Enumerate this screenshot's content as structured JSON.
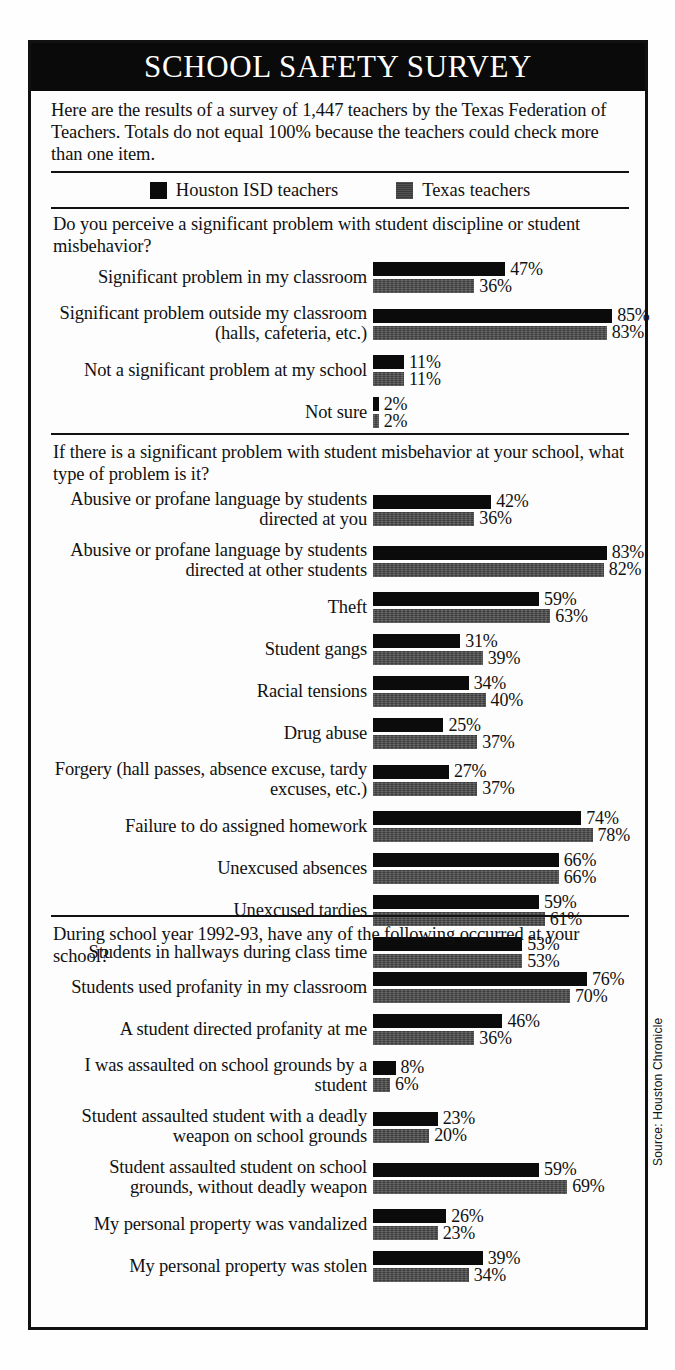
{
  "header": {
    "title": "SCHOOL SAFETY SURVEY"
  },
  "intro": {
    "text": "Here are the results of a survey of 1,447 teachers by the Texas Federation of Teachers. Totals do not equal 100% because the teachers could check more than one item."
  },
  "legend": {
    "series": [
      {
        "name": "houston",
        "label": "Houston ISD teachers",
        "color": "#0b0b0b",
        "swatch": "black"
      },
      {
        "name": "texas",
        "label": "Texas teachers",
        "color": "#3b3b3b",
        "swatch": "gray"
      }
    ]
  },
  "source": {
    "text": "Source:  Houston Chronicle"
  },
  "chart_data": {
    "type": "bar",
    "title": "SCHOOL SAFETY SURVEY",
    "xlabel": "",
    "ylabel": "",
    "xlim": [
      0,
      100
    ],
    "grid": false,
    "legend_position": "top",
    "orientation": "horizontal",
    "value_suffix": "%",
    "series_names": [
      "Houston ISD teachers",
      "Texas teachers"
    ],
    "sections": [
      {
        "question": "Do you perceive a significant problem with student discipline or student misbehavior?",
        "items": [
          {
            "label": "Significant problem in my classroom",
            "houston": 47,
            "texas": 36,
            "houston_text": "47%",
            "texas_text": "36%"
          },
          {
            "label": "Significant problem outside my classroom (halls, cafeteria, etc.)",
            "houston": 85,
            "texas": 83,
            "houston_text": "85%",
            "texas_text": "83%"
          },
          {
            "label": "Not a significant problem at my school",
            "houston": 11,
            "texas": 11,
            "houston_text": "11%",
            "texas_text": "11%"
          },
          {
            "label": "Not sure",
            "houston": 2,
            "texas": 2,
            "houston_text": "2%",
            "texas_text": "2%"
          }
        ]
      },
      {
        "question": "If there is a significant problem with student misbehavior at your school, what type of problem is it?",
        "items": [
          {
            "label": "Abusive or profane language by students directed at you",
            "houston": 42,
            "texas": 36,
            "houston_text": "42%",
            "texas_text": "36%"
          },
          {
            "label": "Abusive or profane language by students directed at other students",
            "houston": 83,
            "texas": 82,
            "houston_text": "83%",
            "texas_text": "82%"
          },
          {
            "label": "Theft",
            "houston": 59,
            "texas": 63,
            "houston_text": "59%",
            "texas_text": "63%"
          },
          {
            "label": "Student gangs",
            "houston": 31,
            "texas": 39,
            "houston_text": "31%",
            "texas_text": "39%"
          },
          {
            "label": "Racial tensions",
            "houston": 34,
            "texas": 40,
            "houston_text": "34%",
            "texas_text": "40%"
          },
          {
            "label": "Drug abuse",
            "houston": 25,
            "texas": 37,
            "houston_text": "25%",
            "texas_text": "37%"
          },
          {
            "label": "Forgery (hall passes, absence excuse, tardy excuses, etc.)",
            "houston": 27,
            "texas": 37,
            "houston_text": "27%",
            "texas_text": "37%"
          },
          {
            "label": "Failure to do assigned homework",
            "houston": 74,
            "texas": 78,
            "houston_text": "74%",
            "texas_text": "78%"
          },
          {
            "label": "Unexcused absences",
            "houston": 66,
            "texas": 66,
            "houston_text": "66%",
            "texas_text": "66%"
          },
          {
            "label": "Unexcused tardies",
            "houston": 59,
            "texas": 61,
            "houston_text": "59%",
            "texas_text": "61%"
          },
          {
            "label": "Students in hallways during class time",
            "houston": 53,
            "texas": 53,
            "houston_text": "53%",
            "texas_text": "53%"
          }
        ]
      },
      {
        "question": "During school year 1992-93, have any of the following occurred at your school?",
        "items": [
          {
            "label": "Students used profanity in my classroom",
            "houston": 76,
            "texas": 70,
            "houston_text": "76%",
            "texas_text": "70%"
          },
          {
            "label": "A student directed profanity at me",
            "houston": 46,
            "texas": 36,
            "houston_text": "46%",
            "texas_text": "36%"
          },
          {
            "label": "I was assaulted on school grounds by a student",
            "houston": 8,
            "texas": 6,
            "houston_text": "8%",
            "texas_text": "6%"
          },
          {
            "label": "Student assaulted student with a deadly weapon on school grounds",
            "houston": 23,
            "texas": 20,
            "houston_text": "23%",
            "texas_text": "20%"
          },
          {
            "label": "Student assaulted student on school grounds, without deadly weapon",
            "houston": 59,
            "texas": 69,
            "houston_text": "59%",
            "texas_text": "69%"
          },
          {
            "label": "My personal property was vandalized",
            "houston": 26,
            "texas": 23,
            "houston_text": "26%",
            "texas_text": "23%"
          },
          {
            "label": "My personal property was stolen",
            "houston": 39,
            "texas": 34,
            "houston_text": "39%",
            "texas_text": "34%"
          }
        ]
      }
    ]
  }
}
